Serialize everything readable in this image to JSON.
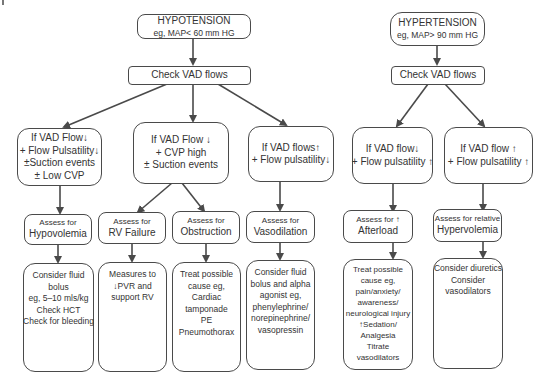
{
  "hypotension": {
    "title": "HYPOTENSION",
    "subtitle": "eg, MAP< 60 mm HG",
    "check": "Check VAD flows",
    "branches": [
      {
        "condition": [
          "If VAD Flow↓",
          "+ Flow Pulsatility↓",
          "±Suction events",
          "± Low CVP"
        ],
        "assessments": [
          {
            "assess_label": "Assess for",
            "assess_target": "Hypovolemia",
            "action": [
              "Consider fluid",
              "bolus",
              "eg, 5–10 mls/kg",
              "Check HCT",
              "Check for bleeding"
            ]
          }
        ]
      },
      {
        "condition": [
          "If VAD Flow ↓",
          "+ CVP high",
          "± Suction events"
        ],
        "assessments": [
          {
            "assess_label": "Assess for",
            "assess_target": "RV Failure",
            "action": [
              "Measures to",
              "↓PVR and",
              "support RV"
            ]
          },
          {
            "assess_label": "Assess for",
            "assess_target": "Obstruction",
            "action": [
              "Treat possible",
              "cause eg,",
              "Cardiac",
              "tamponade",
              "PE",
              "Pneumothorax"
            ]
          }
        ]
      },
      {
        "condition": [
          "If VAD flows↑",
          "+ Flow pulsatility↓"
        ],
        "assessments": [
          {
            "assess_label": "Assess for",
            "assess_target": "Vasodilation",
            "action": [
              "Consider fluid",
              "bolus and alpha",
              "agonist eg,",
              "phenylephrine/",
              "norepinephrine/",
              "vasopressin"
            ]
          }
        ]
      }
    ]
  },
  "hypertension": {
    "title": "HYPERTENSION",
    "subtitle": "eg, MAP> 90 mm HG",
    "check": "Check VAD flows",
    "branches": [
      {
        "condition": [
          "If VAD flow↓",
          "+ Flow pulsatility ↑"
        ],
        "assess_label": "Assess for ↑",
        "assess_target": "Afterload",
        "action": [
          "Treat possible",
          "cause eg,",
          "pain/anxiety/",
          "awareness/",
          "neurological injury",
          "↑Sedation/",
          "Analgesia",
          "Titrate",
          "vasodilators"
        ]
      },
      {
        "condition": [
          "If VAD flow ↑",
          "+ Flow pulsatility ↑"
        ],
        "assess_label": "Assess for relative",
        "assess_target": "Hypervolemia",
        "action": [
          "Consider diuretics",
          "Consider",
          "vasodilators"
        ]
      }
    ]
  },
  "colors": {
    "line": "#4a4a4a",
    "text": "#333333",
    "background": "#ffffff"
  }
}
